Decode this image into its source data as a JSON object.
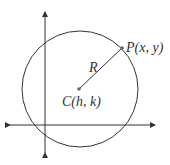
{
  "diagram": {
    "type": "circle-equation-geometry",
    "colors": {
      "stroke": "#333333",
      "point": "#666666",
      "background": "#ffffff"
    },
    "axes": {
      "x_axis": {
        "y": 125,
        "x_start": 10,
        "x_end": 155,
        "arrows": "both"
      },
      "y_axis": {
        "x": 45,
        "y_start": 12,
        "y_end": 153,
        "arrows": "both"
      }
    },
    "circle": {
      "cx": 80,
      "cy": 89,
      "r": 58
    },
    "center_point": {
      "x": 79,
      "y": 89,
      "label": "C(h, k)"
    },
    "radius_point": {
      "x": 122,
      "y": 48,
      "label": "P(x, y)"
    },
    "radius_label": "R"
  }
}
